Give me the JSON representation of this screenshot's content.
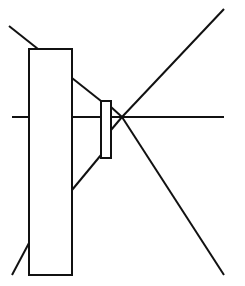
{
  "diagram": {
    "type": "optical-ray-diagram",
    "colors": {
      "stroke": "#111111",
      "background": "#ffffff"
    },
    "elements": {
      "large_rect": {
        "x": 29,
        "y": 49,
        "width": 43,
        "height": 226
      },
      "small_rect": {
        "x": 101,
        "y": 101,
        "width": 10,
        "height": 57
      },
      "focal_point": {
        "x": 122,
        "y": 117
      },
      "axis_y": 117
    },
    "labels": []
  }
}
